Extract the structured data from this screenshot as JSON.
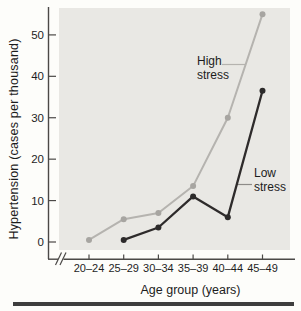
{
  "chart_data": {
    "type": "line",
    "title": "",
    "xlabel": "Age group (years)",
    "ylabel": "Hypertension (cases per thousand)",
    "categories": [
      "20–24",
      "25–29",
      "30–34",
      "35–39",
      "40–44",
      "45–49"
    ],
    "y_ticks": [
      0,
      10,
      20,
      30,
      40,
      50
    ],
    "ylim": [
      0,
      57
    ],
    "grid": false,
    "axis_break_on_x": true,
    "legend_position": "inline-labels",
    "series": [
      {
        "name": "High stress",
        "color": "#b5b3af",
        "point_color": "#a7a5a1",
        "values": [
          0.5,
          5.5,
          7,
          13.5,
          30,
          55
        ]
      },
      {
        "name": "Low stress",
        "color": "#2e2b2b",
        "point_color": "#2c2a2a",
        "values": [
          null,
          0.5,
          3.5,
          11,
          6,
          36.5
        ]
      }
    ]
  },
  "colors": {
    "plot_bg": "#e9e8e4",
    "axis": "#4b4947",
    "text": "#1e1e1e",
    "leader_low": "#8d8b88",
    "bottom_rule": "#3e3e3e"
  }
}
